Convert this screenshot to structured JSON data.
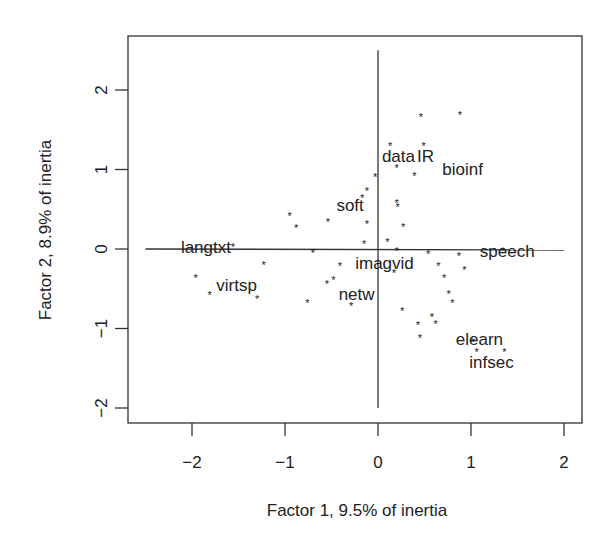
{
  "chart_data": {
    "type": "scatter",
    "title": "",
    "xlabel": "Factor 1, 9.5% of inertia",
    "ylabel": "Factor 2, 8.9% of inertia",
    "xlim": [
      -2.7,
      2.2
    ],
    "ylim": [
      -2.2,
      2.65
    ],
    "xticks": [
      -2,
      -1,
      0,
      1,
      2
    ],
    "yticks": [
      -2,
      -1,
      0,
      1,
      2
    ],
    "grid": false,
    "legend": null,
    "reference_lines": {
      "horizontal": {
        "y": 0,
        "x_from": -2.5,
        "x_to": 2.0
      },
      "vertical": {
        "x": 0,
        "y_from": -2.0,
        "y_to": 2.5
      }
    },
    "marker": "*",
    "points": [
      {
        "x": 0.46,
        "y": 1.66
      },
      {
        "x": 0.88,
        "y": 1.69
      },
      {
        "x": 0.13,
        "y": 1.29
      },
      {
        "x": 0.49,
        "y": 1.29
      },
      {
        "x": 0.2,
        "y": 1.02
      },
      {
        "x": 0.39,
        "y": 0.92
      },
      {
        "x": -0.03,
        "y": 0.91
      },
      {
        "x": -0.12,
        "y": 0.73
      },
      {
        "x": 0.2,
        "y": 0.58
      },
      {
        "x": 0.21,
        "y": 0.53
      },
      {
        "x": -0.17,
        "y": 0.64
      },
      {
        "x": -0.95,
        "y": 0.42
      },
      {
        "x": -0.88,
        "y": 0.27
      },
      {
        "x": -0.54,
        "y": 0.34
      },
      {
        "x": -0.12,
        "y": 0.32
      },
      {
        "x": 0.27,
        "y": 0.28
      },
      {
        "x": 0.1,
        "y": 0.09
      },
      {
        "x": -0.15,
        "y": 0.06
      },
      {
        "x": -1.56,
        "y": 0.03
      },
      {
        "x": 0.2,
        "y": -0.03
      },
      {
        "x": -0.7,
        "y": -0.05
      },
      {
        "x": 0.54,
        "y": -0.06
      },
      {
        "x": 0.87,
        "y": -0.09
      },
      {
        "x": -1.23,
        "y": -0.2
      },
      {
        "x": -0.41,
        "y": -0.21
      },
      {
        "x": 0.65,
        "y": -0.21
      },
      {
        "x": 0.93,
        "y": -0.27
      },
      {
        "x": 0.17,
        "y": -0.3
      },
      {
        "x": 0.71,
        "y": -0.36
      },
      {
        "x": -1.96,
        "y": -0.36
      },
      {
        "x": -0.48,
        "y": -0.39
      },
      {
        "x": -0.55,
        "y": -0.44
      },
      {
        "x": 0.76,
        "y": -0.56
      },
      {
        "x": -1.81,
        "y": -0.58
      },
      {
        "x": -1.3,
        "y": -0.63
      },
      {
        "x": 0.8,
        "y": -0.68
      },
      {
        "x": -0.76,
        "y": -0.68
      },
      {
        "x": -0.29,
        "y": -0.72
      },
      {
        "x": 0.26,
        "y": -0.78
      },
      {
        "x": 0.58,
        "y": -0.85
      },
      {
        "x": 0.62,
        "y": -0.94
      },
      {
        "x": 0.43,
        "y": -0.95
      },
      {
        "x": 0.45,
        "y": -1.12
      },
      {
        "x": 1.02,
        "y": -1.17
      },
      {
        "x": 1.06,
        "y": -1.29
      },
      {
        "x": 1.36,
        "y": -1.29
      },
      {
        "x": 1.34,
        "y": -0.02
      }
    ],
    "labels": [
      {
        "text": "data",
        "x": 0.22,
        "y": 1.17
      },
      {
        "text": "IR",
        "x": 0.51,
        "y": 1.17
      },
      {
        "text": "bioinf",
        "x": 0.91,
        "y": 1.01
      },
      {
        "text": "soft",
        "x": -0.3,
        "y": 0.55
      },
      {
        "text": "langtxt",
        "x": -1.85,
        "y": 0.03
      },
      {
        "text": "speech",
        "x": 1.39,
        "y": -0.03
      },
      {
        "text": "imagvid",
        "x": 0.07,
        "y": -0.17
      },
      {
        "text": "virtsp",
        "x": -1.52,
        "y": -0.45
      },
      {
        "text": "netw",
        "x": -0.23,
        "y": -0.57
      },
      {
        "text": "elearn",
        "x": 1.09,
        "y": -1.13
      },
      {
        "text": "infsec",
        "x": 1.22,
        "y": -1.42
      }
    ]
  }
}
